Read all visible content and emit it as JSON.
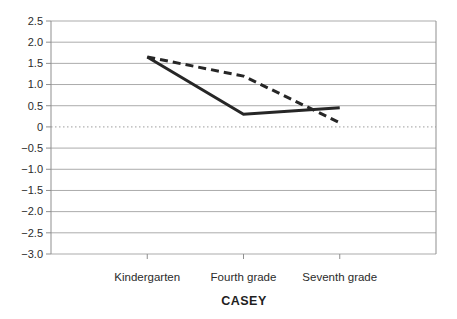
{
  "figure": {
    "background": "#ffffff"
  },
  "chart_data": {
    "type": "line",
    "title": "",
    "xlabel": "CASEY",
    "ylabel": "",
    "categories": [
      "Kindergarten",
      "Fourth grade",
      "Seventh grade"
    ],
    "series": [
      {
        "name": "solid-line",
        "style": "solid",
        "color": "#262626",
        "width": 3,
        "values": [
          1.65,
          0.3,
          0.45
        ]
      },
      {
        "name": "dashed-line",
        "style": "dashed",
        "color": "#262626",
        "width": 3,
        "dash": "8 5",
        "values": [
          1.65,
          1.2,
          0.1
        ]
      }
    ],
    "ylim": [
      -3.0,
      2.5
    ],
    "ytick_step": 0.5,
    "ytick_labels": [
      "2.5",
      "2.0",
      "1.5",
      "1.0",
      "0.5",
      "0",
      "−0.5",
      "−1.0",
      "−1.5",
      "−2.0",
      "−2.5",
      "−3.0"
    ],
    "grid": true,
    "zero_line": "dotted",
    "legend": "none",
    "colors": {
      "gridline": "#ababab",
      "axis": "#8f8f8f",
      "zero_line": "#9e9e9e",
      "text": "#2b2b2b"
    }
  }
}
